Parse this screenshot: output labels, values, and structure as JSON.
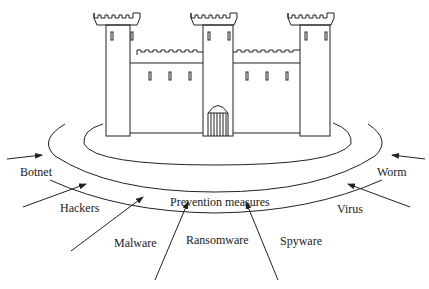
{
  "diagram": {
    "center_label": "Prevention measures",
    "structure": "castle",
    "threats": [
      {
        "label": "Botnet"
      },
      {
        "label": "Hackers"
      },
      {
        "label": "Malware"
      },
      {
        "label": "Ransomware"
      },
      {
        "label": "Spyware"
      },
      {
        "label": "Virus"
      },
      {
        "label": "Worm"
      }
    ],
    "colors": {
      "stroke": "#222222",
      "background": "#ffffff"
    }
  }
}
